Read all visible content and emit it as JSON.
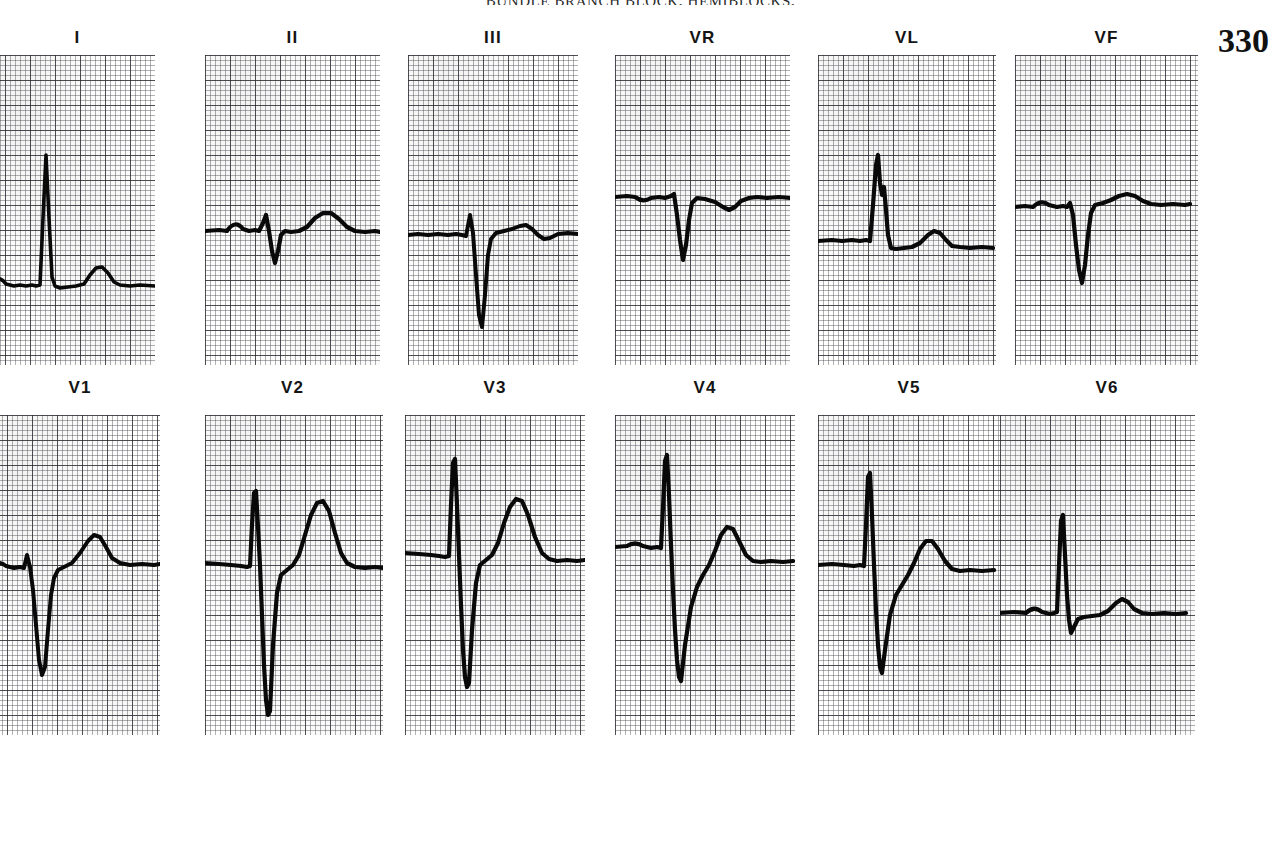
{
  "page": {
    "running_head": "BUNDLE BRANCH BLOCK, HEMIBLOCKS,",
    "page_number": "330"
  },
  "chart_data": {
    "type": "line",
    "xlabel": "time",
    "ylabel": "voltage",
    "grid": true,
    "grid_small_mm_px": 5,
    "grid_large_mm_px": 25,
    "legend": "none",
    "rows": [
      {
        "name": "limb-leads",
        "leads": [
          {
            "label": "I",
            "baseline_y": 230,
            "path": "M0,230 L10,230 Q18,218 26,229 L34,231 L40,230 L46,231 L52,230 L56,231 L60,230 L63,163 L66,100 L69,163 L72,222 L75,231 L80,233 L88,232 L96,231 L104,229 L110,220 L116,213 L122,212 L128,218 L134,227 L140,230 L150,231 L160,230 L175,231",
            "morphology": "small P, tall narrow R, upright T"
          },
          {
            "label": "II",
            "baseline_y": 175,
            "path": "M0,176 L14,175 L22,176 Q30,164 38,174 L44,176 L50,175 L54,176 L58,168 L61,160 L64,176 L67,196 L70,208 L73,196 L76,180 L80,176 L86,177 L94,176 L102,172 L110,163 L118,158 L126,158 L134,164 L142,172 L150,176 L160,177 L170,176 L175,177",
            "morphology": "P wave, rS complex, broad upright T"
          },
          {
            "label": "III",
            "baseline_y": 178,
            "path": "M0,180 L10,179 L20,180 L30,179 L40,180 L48,179 L54,180 L58,181 L62,160 L65,178 L68,220 L71,260 L74,272 L77,240 L80,200 L83,184 L88,178 L96,176 L104,174 L112,171 L118,170 L124,174 L130,180 L136,184 L142,183 L150,179 L160,178 L170,179 L175,178",
            "morphology": "small r, deep narrow S, flat T"
          },
          {
            "label": "VR",
            "baseline_y": 140,
            "path": "M0,142 L12,141 L20,142 Q28,148 36,143 L44,142 L50,143 L56,141 L59,139 L62,160 L65,185 L68,205 L71,190 L74,165 L77,148 L82,143 L90,144 L100,147 L108,152 L114,155 L120,152 L126,146 L134,143 L142,142 L152,143 L164,142 L175,143",
            "morphology": "inverted P, QS complex, inverted T"
          },
          {
            "label": "VL",
            "baseline_y": 185,
            "path": "M0,186 L14,185 L24,186 L34,185 L42,186 L48,185 L52,186 L55,150 L58,110 L60,100 L62,128 L64,140 L66,132 L68,155 L70,180 L73,193 L78,194 L86,193 L94,192 L102,188 L110,180 L116,176 L122,178 L128,185 L134,191 L142,192 L152,193 L164,192 L175,193",
            "morphology": "tall notched R, small upright T"
          },
          {
            "label": "VF",
            "baseline_y": 150,
            "path": "M0,152 L10,151 L18,152 Q26,144 34,150 L42,152 L48,151 L52,152 L55,148 L58,160 L61,190 L64,215 L67,228 L70,210 L73,180 L76,158 L80,150 L88,148 L96,145 L104,141 L112,139 L120,141 L128,146 L136,149 L146,150 L158,149 L170,150 L175,149",
            "morphology": "P wave, rS complex, small T"
          }
        ]
      },
      {
        "name": "chest-leads",
        "leads": [
          {
            "label": "V1",
            "baseline_y": 150,
            "path": "M0,152 L8,151 Q16,145 24,151 L32,153 L38,152 L42,153 L45,140 L48,152 L51,175 L54,210 L57,245 L60,260 L63,252 L66,215 L69,180 L72,163 L76,155 L82,152 L90,148 L98,138 L106,126 L112,120 L118,122 L124,132 L130,143 L138,148 L148,150 L160,149 L172,150 L178,149",
            "morphology": "small r, very deep S, elevated ST, tall T"
          },
          {
            "label": "V2",
            "baseline_y": 150,
            "path": "M0,148 L14,149 L26,150 L36,151 L42,152 L45,151 L47,110 L49,78 L51,76 L53,112 L55,150 L57,200 L59,250 L61,285 L63,300 L65,296 L68,230 L72,178 L76,160 L82,155 L88,150 L94,140 L100,120 L106,100 L112,88 L118,86 L124,96 L130,118 L136,138 L142,148 L150,152 L160,153 L170,152 L178,153",
            "morphology": "tall R spike, very deep S, large peaked T"
          },
          {
            "label": "V3",
            "baseline_y": 140,
            "path": "M0,138 L14,139 L26,140 L34,141 L40,142 L44,141 L46,90 L48,48 L50,44 L52,90 L54,140 L56,190 L58,235 L60,262 L62,272 L64,268 L67,215 L71,168 L75,150 L81,145 L87,140 L93,128 L99,108 L105,92 L111,84 L117,86 L123,100 L130,122 L137,138 L144,144 L152,146 L162,145 L172,146 L180,145",
            "morphology": "tall R, deep S, tall peaked T"
          },
          {
            "label": "V4",
            "baseline_y": 130,
            "path": "M0,132 L12,131 Q20,126 28,131 L36,133 L42,132 L46,133 L48,92 L50,46 L52,40 L54,80 L56,130 L58,175 L60,215 L62,245 L64,262 L66,266 L70,230 L76,192 L82,172 L88,160 L94,150 L100,136 L106,120 L112,112 L118,114 L124,126 L131,140 L138,146 L146,147 L156,146 L168,147 L178,146",
            "morphology": "tall R, deep S, prominent T"
          },
          {
            "label": "V5",
            "baseline_y": 148,
            "path": "M0,150 L14,149 L26,150 L36,151 L42,150 L46,151 L48,110 L50,62 L52,58 L54,100 L56,150 L58,195 L60,230 L62,252 L64,258 L67,235 L72,200 L78,180 L84,170 L90,160 L96,148 L102,134 L108,126 L114,126 L120,134 L127,146 L134,154 L142,156 L152,155 L164,156 L176,155",
            "morphology": "tall R, deep S, upright T"
          },
          {
            "label": "V6",
            "baseline_y": 196,
            "path": "M0,198 L14,197 L26,198 Q34,190 42,197 L50,199 L54,198 L57,197 L59,150 L61,106 L63,100 L65,140 L67,180 L69,205 L71,218 L74,212 L78,204 L84,202 L92,201 L100,200 L108,196 L116,188 L122,184 L128,187 L134,194 L142,198 L152,199 L164,198 L176,199 L186,198",
            "morphology": "tall narrow R, small s, small T"
          }
        ]
      }
    ]
  }
}
